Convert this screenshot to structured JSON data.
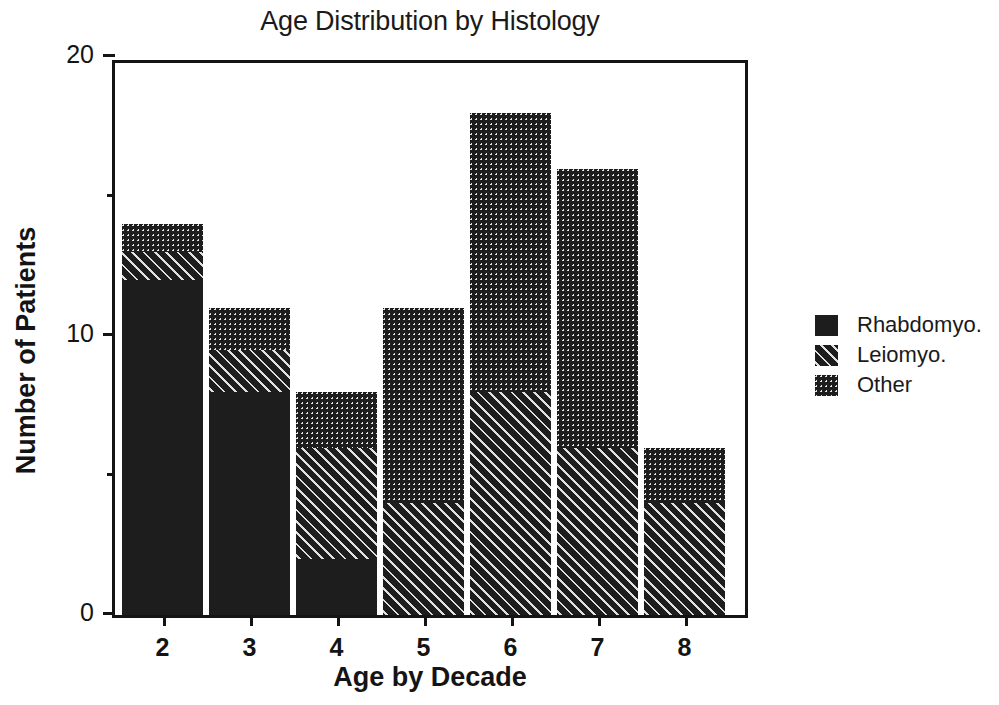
{
  "chart_data": {
    "type": "bar",
    "title": "Age Distribution by Histology",
    "xlabel": "Age by Decade",
    "ylabel": "Number of Patients",
    "categories": [
      "2",
      "3",
      "4",
      "5",
      "6",
      "7",
      "8"
    ],
    "stacked": true,
    "series": [
      {
        "name": "Rhabdomyo.",
        "pattern": "solid",
        "values": [
          12,
          8,
          2,
          0,
          0,
          0,
          0
        ]
      },
      {
        "name": "Leiomyo.",
        "pattern": "hatch",
        "values": [
          1,
          1.5,
          4,
          4,
          8,
          6,
          4
        ]
      },
      {
        "name": "Other",
        "pattern": "dots",
        "values": [
          1,
          1.5,
          2,
          7,
          10,
          10,
          2
        ]
      }
    ],
    "totals": [
      14,
      11,
      8,
      11,
      18,
      16,
      6
    ],
    "ylim": [
      0,
      20
    ],
    "yticks": [
      0,
      10,
      20
    ],
    "ytick_labels": [
      "0",
      "10",
      "20"
    ],
    "yminor_ticks": [
      5,
      15
    ],
    "grid": false,
    "legend_position": "right"
  },
  "legend": {
    "entries": [
      {
        "label": "Rhabdomyo.",
        "pattern": "solid"
      },
      {
        "label": "Leiomyo.",
        "pattern": "hatch"
      },
      {
        "label": "Other",
        "pattern": "dots"
      }
    ]
  }
}
